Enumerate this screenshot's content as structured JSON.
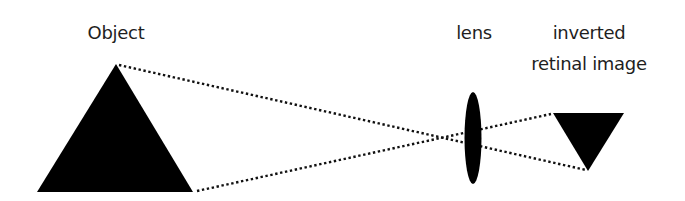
{
  "diagram": {
    "labels": {
      "object": "Object",
      "lens": "lens",
      "image_line1": "inverted",
      "image_line2": "retinal image"
    },
    "colors": {
      "shape_fill": "#000000",
      "ray_color": "#111111",
      "text_color": "#1e1e1e",
      "background": "#ffffff"
    },
    "shapes": {
      "object_triangle": {
        "apex": [
          116,
          64
        ],
        "base_left": [
          37,
          192
        ],
        "base_right": [
          193,
          192
        ]
      },
      "lens_ellipse": {
        "cx": 473,
        "cy": 138,
        "rx": 8.5,
        "ry": 46
      },
      "inverted_triangle": {
        "top_left": [
          553,
          113
        ],
        "top_right": [
          624,
          113
        ],
        "tip": [
          588,
          171
        ]
      }
    },
    "rays": [
      {
        "name": "top-ray",
        "from": [
          119,
          65
        ],
        "to": [
          586,
          170
        ]
      },
      {
        "name": "bottom-ray",
        "from": [
          197,
          191
        ],
        "to": [
          551,
          114
        ]
      }
    ]
  }
}
